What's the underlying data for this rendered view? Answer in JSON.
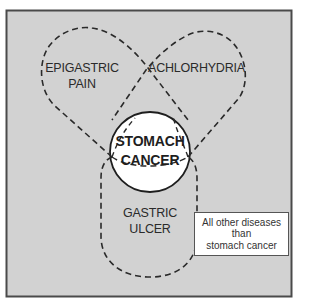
{
  "diagram": {
    "type": "venn",
    "colors": {
      "universe_fill": "#d2d2d2",
      "universe_border": "#4a4a4a",
      "circle_fill": "#ffffff",
      "outline": "#2a2a2a"
    },
    "sets": [
      {
        "id": "epigastric_pain",
        "label_line1": "EPIGASTRIC",
        "label_line2": "PAIN",
        "style": "dashed"
      },
      {
        "id": "achlorhydria",
        "label": "ACHLORHYDRIA",
        "style": "dashed"
      },
      {
        "id": "gastric_ulcer",
        "label_line1": "GASTRIC",
        "label_line2": "ULCER",
        "style": "dashed"
      },
      {
        "id": "stomach_cancer",
        "label_line1": "STOMACH",
        "label_line2": "CANCER",
        "style": "solid"
      }
    ],
    "legend": {
      "line1": "All other diseases",
      "line2": "than",
      "line3": "stomach cancer"
    }
  }
}
